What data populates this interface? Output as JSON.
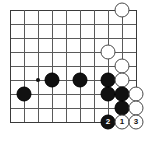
{
  "diagram": {
    "kind": "go-board",
    "board": {
      "cols": 10,
      "rows": 9,
      "origin_x": 10,
      "origin_y": 10,
      "spacing": 14,
      "line_color": "#5a5a5a",
      "edge_color": "#3a3a3a",
      "background": "#ffffff"
    },
    "hoshi_points": [
      {
        "name": "star-point-left",
        "x": 38,
        "y": 80
      }
    ],
    "stones": [
      {
        "name": "white-stone-top-right",
        "color": "white",
        "x": 122,
        "y": 10,
        "label": ""
      },
      {
        "name": "white-stone-upper",
        "color": "white",
        "x": 108,
        "y": 52,
        "label": ""
      },
      {
        "name": "white-stone-col9-r5",
        "color": "white",
        "x": 122,
        "y": 66,
        "label": ""
      },
      {
        "name": "black-stone-far-left",
        "color": "black",
        "x": 24,
        "y": 94,
        "label": ""
      },
      {
        "name": "black-stone-left-a",
        "color": "black",
        "x": 52,
        "y": 80,
        "label": ""
      },
      {
        "name": "black-stone-left-b",
        "color": "black",
        "x": 80,
        "y": 80,
        "label": ""
      },
      {
        "name": "black-stone-wall-top",
        "color": "black",
        "x": 108,
        "y": 80,
        "label": ""
      },
      {
        "name": "white-stone-col9-r6",
        "color": "white",
        "x": 122,
        "y": 80,
        "label": ""
      },
      {
        "name": "black-stone-wall-mid",
        "color": "black",
        "x": 108,
        "y": 94,
        "label": ""
      },
      {
        "name": "black-stone-wall-mid-right",
        "color": "black",
        "x": 122,
        "y": 94,
        "label": ""
      },
      {
        "name": "white-stone-col10-r7",
        "color": "white",
        "x": 136,
        "y": 94,
        "label": ""
      },
      {
        "name": "black-stone-wall-low",
        "color": "black",
        "x": 122,
        "y": 108,
        "label": ""
      },
      {
        "name": "white-stone-col10-r8",
        "color": "white",
        "x": 136,
        "y": 108,
        "label": ""
      },
      {
        "name": "black-move-2",
        "color": "black",
        "x": 108,
        "y": 122,
        "label": "2"
      },
      {
        "name": "white-move-1",
        "color": "white",
        "x": 122,
        "y": 122,
        "label": "1"
      },
      {
        "name": "white-move-3",
        "color": "white",
        "x": 136,
        "y": 122,
        "label": "3"
      }
    ],
    "move_numbers": {
      "black_moves": [
        "2"
      ],
      "white_moves": [
        "1",
        "3"
      ]
    }
  }
}
